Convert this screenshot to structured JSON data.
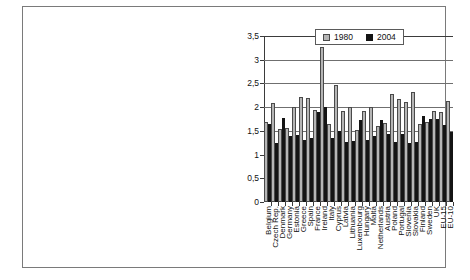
{
  "chart_data": {
    "type": "bar",
    "title": "",
    "subtitle": "",
    "xlabel": "",
    "ylabel": "",
    "ylim": [
      0,
      3.5
    ],
    "yticks": [
      "0",
      "0,5",
      "1",
      "1,5",
      "2",
      "2,5",
      "3",
      "3,5"
    ],
    "ytick_values": [
      0,
      0.5,
      1,
      1.5,
      2,
      2.5,
      3,
      3.5
    ],
    "grid": true,
    "legend_position": "top-right",
    "categories": [
      "Belgium",
      "Czech Rep.",
      "Denmark",
      "Germany",
      "Estonia",
      "Greece",
      "Spain",
      "France",
      "Ireland",
      "Italy",
      "Cyprus",
      "Latvia",
      "Lithuania",
      "Luxembourg",
      "Hungary",
      "Malta",
      "Netherlands",
      "Austria",
      "Poland",
      "Portugal",
      "Slovenia",
      "Slovakia",
      "Finland",
      "Sweden",
      "UK",
      "EU-15",
      "EU-10"
    ],
    "series": [
      {
        "name": "1980",
        "color": "#b5b5b5",
        "values": [
          1.68,
          2.09,
          1.55,
          1.56,
          2.01,
          2.21,
          2.2,
          1.95,
          3.26,
          1.65,
          2.47,
          1.91,
          2.01,
          1.52,
          1.92,
          2.01,
          1.61,
          1.66,
          2.28,
          2.18,
          2.11,
          2.33,
          1.65,
          1.69,
          1.91,
          1.89,
          2.13
        ]
      },
      {
        "name": "2004",
        "color": "#141414",
        "values": [
          1.64,
          1.24,
          1.78,
          1.39,
          1.42,
          1.3,
          1.34,
          1.9,
          2.0,
          1.34,
          1.5,
          1.26,
          1.28,
          1.72,
          1.3,
          1.4,
          1.73,
          1.44,
          1.26,
          1.44,
          1.24,
          1.27,
          1.81,
          1.76,
          1.76,
          1.63,
          1.47
        ]
      }
    ]
  },
  "legend": {
    "items": [
      {
        "label": "1980"
      },
      {
        "label": "2004"
      }
    ]
  }
}
